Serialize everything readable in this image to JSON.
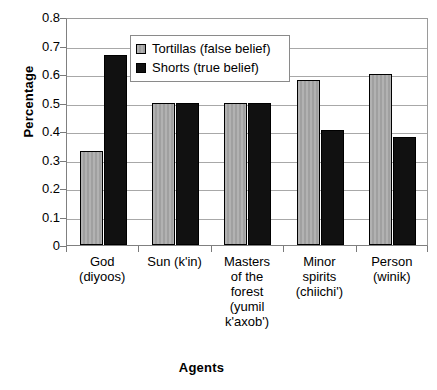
{
  "chart_data": {
    "type": "bar",
    "title": "",
    "xlabel": "Agents",
    "ylabel": "Percentage",
    "ylim": [
      0,
      0.8
    ],
    "ytick_labels": [
      "0.8",
      "0.7",
      "0.6",
      "0.5",
      "0.4",
      "0.3",
      "0.2",
      "0.1",
      "0"
    ],
    "ytick_values": [
      0.8,
      0.7,
      0.6,
      0.5,
      0.4,
      0.3,
      0.2,
      0.1,
      0
    ],
    "grid": true,
    "legend_position": "top-center-inside",
    "categories": [
      "God (diyoos)",
      "Sun (k'in)",
      "Masters of the forest (yumil k'axob')",
      "Minor spirits (chiichi')",
      "Person (winik)"
    ],
    "category_lines": [
      [
        "God",
        "(diyoos)"
      ],
      [
        "Sun (k'in)"
      ],
      [
        "Masters",
        "of the",
        "forest",
        "(yumil",
        "k'axob')"
      ],
      [
        "Minor",
        "spirits",
        "(chiichi')"
      ],
      [
        "Person",
        "(winik)"
      ]
    ],
    "series": [
      {
        "name": "Tortillas (false belief)",
        "color": "#a8a8a8",
        "values": [
          0.33,
          0.5,
          0.5,
          0.58,
          0.6
        ]
      },
      {
        "name": "Shorts (true belief)",
        "color": "#111111",
        "values": [
          0.665,
          0.5,
          0.5,
          0.405,
          0.38
        ]
      }
    ]
  }
}
